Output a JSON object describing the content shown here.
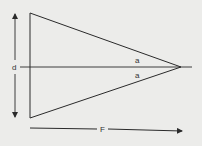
{
  "diagram": {
    "labels": {
      "diameter": "d",
      "angle_upper": "a",
      "angle_lower": "a",
      "focal_length": "F"
    },
    "colors": {
      "background": "#ececea",
      "stroke": "#2a2a2a"
    }
  }
}
